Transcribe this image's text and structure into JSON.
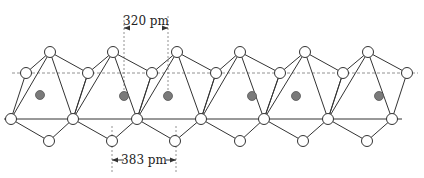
{
  "diagram": {
    "type": "octahedral-chain",
    "labels": {
      "top_distance": "320 pm",
      "bottom_distance": "383 pm"
    },
    "colors": {
      "line": "#333333",
      "node_fill": "#ffffff",
      "metal_fill": "#7a7a7a",
      "dashed": "#777777"
    },
    "nodes": {
      "top": [
        [
          50,
          52
        ],
        [
          113,
          52
        ],
        [
          177,
          52
        ],
        [
          240,
          52
        ],
        [
          305,
          52
        ],
        [
          368,
          52
        ]
      ],
      "mid": [
        [
          26,
          73
        ],
        [
          88,
          73
        ],
        [
          152,
          73
        ],
        [
          216,
          73
        ],
        [
          280,
          73
        ],
        [
          343,
          73
        ],
        [
          407,
          73
        ]
      ],
      "base": [
        [
          11,
          119
        ],
        [
          73,
          119
        ],
        [
          137,
          119
        ],
        [
          201,
          119
        ],
        [
          264,
          119
        ],
        [
          328,
          119
        ],
        [
          392,
          119
        ]
      ],
      "lower": [
        [
          49,
          141
        ],
        [
          112,
          141
        ],
        [
          175,
          141
        ],
        [
          240,
          141
        ],
        [
          303,
          141
        ],
        [
          367,
          141
        ]
      ],
      "metal": [
        [
          40,
          95
        ],
        [
          124,
          96
        ],
        [
          168,
          96
        ],
        [
          252,
          96
        ],
        [
          296,
          96
        ],
        [
          379,
          96
        ]
      ]
    },
    "dimension_lines": {
      "top": {
        "x1": 124,
        "x2": 168,
        "y": 28,
        "label_x": 146,
        "label_y": 25
      },
      "bottom": {
        "x1": 112,
        "x2": 176,
        "y": 160,
        "label_x": 144,
        "label_y": 164
      }
    }
  }
}
